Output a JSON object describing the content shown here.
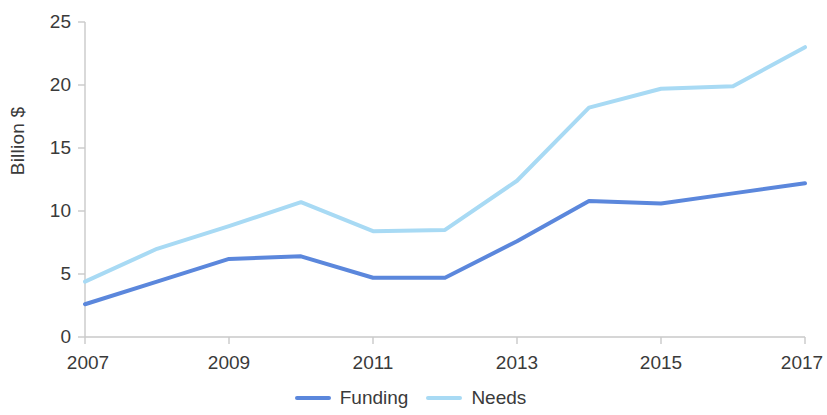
{
  "chart_data": {
    "type": "line",
    "title": "",
    "subtitle": "",
    "xlabel": "",
    "ylabel": "Billion $",
    "x": [
      2007,
      2008,
      2009,
      2010,
      2011,
      2012,
      2013,
      2014,
      2015,
      2016,
      2017
    ],
    "xlim": [
      2007,
      2017
    ],
    "ylim": [
      0,
      25
    ],
    "grid": false,
    "legend_position": "bottom-center",
    "x_tick_labels": [
      "2007",
      "2009",
      "2011",
      "2013",
      "2015",
      "2017"
    ],
    "x_tick_values": [
      2007,
      2009,
      2011,
      2013,
      2015,
      2017
    ],
    "y_tick_labels": [
      "0",
      "5",
      "10",
      "15",
      "20",
      "25"
    ],
    "y_tick_values": [
      0,
      5,
      10,
      15,
      20,
      25
    ],
    "series": [
      {
        "name": "Funding",
        "color": "#5B87DC",
        "values": [
          2.6,
          4.4,
          6.2,
          6.4,
          4.7,
          4.7,
          7.6,
          10.8,
          10.6,
          11.4,
          12.2
        ]
      },
      {
        "name": "Needs",
        "color": "#A8DAF4",
        "values": [
          4.4,
          7.0,
          8.8,
          10.7,
          8.4,
          8.5,
          12.4,
          18.2,
          19.7,
          19.9,
          23.0
        ]
      }
    ]
  },
  "legend": {
    "items": [
      {
        "label": "Funding",
        "color": "#5B87DC"
      },
      {
        "label": "Needs",
        "color": "#A8DAF4"
      }
    ]
  },
  "axes": {
    "y_label": "Billion $",
    "axis_color": "#c9c9c9"
  }
}
